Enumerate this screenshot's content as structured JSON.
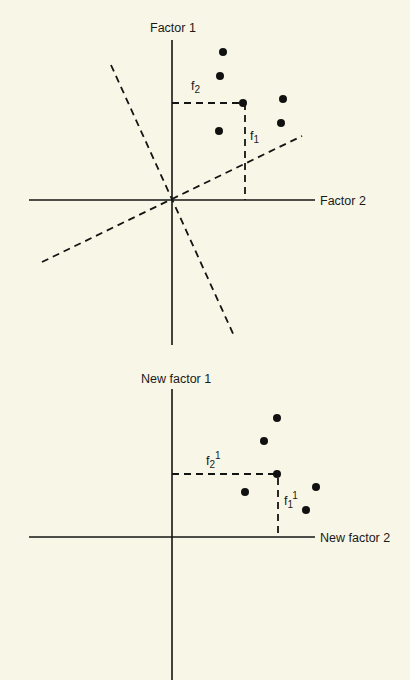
{
  "diagram_top": {
    "y_axis_label": "Factor 1",
    "x_axis_label": "Factor 2",
    "projection_label_f2": "f",
    "projection_label_f2_sub": "2",
    "projection_label_f1": "f",
    "projection_label_f1_sub": "1",
    "points": [
      [
        223,
        52
      ],
      [
        220,
        76
      ],
      [
        243,
        103
      ],
      [
        283,
        99
      ],
      [
        281,
        123
      ],
      [
        219,
        131
      ]
    ],
    "rotated_axes": "dashed lines through origin"
  },
  "diagram_bottom": {
    "y_axis_label": "New factor 1",
    "x_axis_label": "New factor 2",
    "projection_label_f2": "f",
    "projection_label_f2_sub": "2",
    "projection_label_f2_sup": "1",
    "projection_label_f1": "f",
    "projection_label_f1_sub": "1",
    "projection_label_f1_sup": "1",
    "points": [
      [
        277,
        418
      ],
      [
        264,
        441
      ],
      [
        277,
        474
      ],
      [
        245,
        492
      ],
      [
        316,
        487
      ],
      [
        306,
        510
      ]
    ]
  },
  "colors": {
    "background": "#f8f6e6",
    "ink": "#141414"
  }
}
